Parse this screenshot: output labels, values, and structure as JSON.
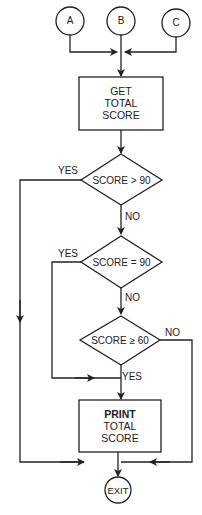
{
  "diagram": {
    "type": "flowchart",
    "connectors": [
      {
        "id": "A",
        "label": "A"
      },
      {
        "id": "B",
        "label": "B"
      },
      {
        "id": "C",
        "label": "C"
      }
    ],
    "process_1": {
      "lines": [
        "GET",
        "TOTAL",
        "SCORE"
      ]
    },
    "decision_1": {
      "condition": "SCORE > 90",
      "yes_label": "YES",
      "no_label": "NO"
    },
    "decision_2": {
      "condition": "SCORE = 90",
      "yes_label": "YES",
      "no_label": "NO"
    },
    "decision_3": {
      "condition": "SCORE ≥ 60",
      "yes_label": "YES",
      "no_label": "NO"
    },
    "process_2": {
      "lines": [
        "PRINT",
        "TOTAL",
        "SCORE"
      ]
    },
    "terminal": {
      "label": "EXIT"
    },
    "colors": {
      "stroke": "#222222",
      "background": "#ffffff"
    }
  }
}
